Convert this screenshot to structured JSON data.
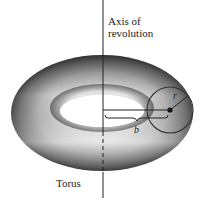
{
  "diagram": {
    "labels": {
      "axis_line1": "Axis of",
      "axis_line2": "revolution",
      "torus": "Torus",
      "b": "b",
      "r": "r"
    },
    "colors": {
      "line": "#222222",
      "torus_light": "#ffffff",
      "torus_dark": "#555555"
    }
  }
}
